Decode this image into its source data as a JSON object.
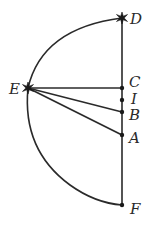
{
  "diagram": {
    "type": "geometry",
    "labels": {
      "D": "D",
      "E": "E",
      "C": "C",
      "I": "I",
      "B": "B",
      "A": "A",
      "F": "F"
    },
    "star_points": [
      "D",
      "E"
    ],
    "dot_points": [
      "C",
      "I",
      "B",
      "A",
      "F"
    ],
    "segments": [
      [
        "D",
        "F"
      ],
      [
        "E",
        "C"
      ],
      [
        "E",
        "B"
      ],
      [
        "E",
        "A"
      ]
    ],
    "arcs": [
      [
        "D",
        "E",
        "F"
      ]
    ],
    "colors": {
      "ink": "#2a2a2a",
      "background": "#ffffff"
    }
  }
}
